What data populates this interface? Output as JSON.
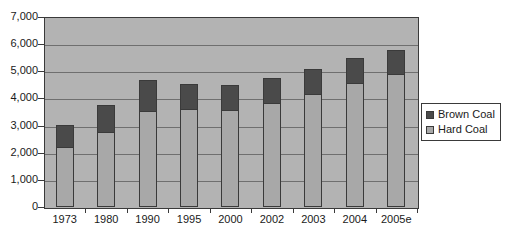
{
  "chart_data": {
    "type": "bar",
    "subtype": "stacked-column",
    "title": "",
    "xlabel": "",
    "ylabel": "",
    "categories": [
      "1973",
      "1980",
      "1990",
      "1995",
      "2000",
      "2002",
      "2003",
      "2004",
      "2005e"
    ],
    "series": [
      {
        "name": "Hard Coal",
        "color": "#a8a8a8",
        "values": [
          2200,
          2780,
          3550,
          3600,
          3560,
          3850,
          4150,
          4570,
          4900
        ]
      },
      {
        "name": "Brown Coal",
        "color": "#4a4a4a",
        "values": [
          820,
          970,
          1130,
          920,
          930,
          910,
          930,
          910,
          900
        ]
      }
    ],
    "totals": [
      3020,
      3750,
      4680,
      4520,
      4490,
      4760,
      5080,
      5480,
      5800
    ],
    "ylim": [
      0,
      7000
    ],
    "ytick_labels": [
      "0",
      "1,000",
      "2,000",
      "3,000",
      "4,000",
      "5,000",
      "6,000",
      "7,000"
    ],
    "ytick_values": [
      0,
      1000,
      2000,
      3000,
      4000,
      5000,
      6000,
      7000
    ],
    "grid": true,
    "grid_axis": "y",
    "legend_position": "right",
    "plot_background": "#b3b3b3",
    "figure_background": "#ffffff",
    "stack_order": [
      "Hard Coal",
      "Brown Coal"
    ]
  },
  "legend": {
    "items": [
      {
        "label": "Brown Coal",
        "color": "#4a4a4a"
      },
      {
        "label": "Hard Coal",
        "color": "#a8a8a8"
      }
    ]
  }
}
